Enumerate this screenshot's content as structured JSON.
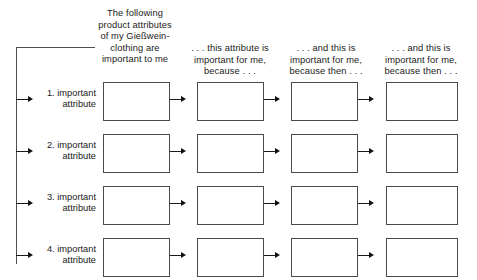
{
  "diagram": {
    "title_text": "Laddering interview grid",
    "columns": [
      {
        "id": "col-attributes",
        "header": "The following product attributes of my Gießwein-clothing are important to me"
      },
      {
        "id": "col-consequence-1",
        "header": ". . . this attribute is important for me, because . . ."
      },
      {
        "id": "col-consequence-2",
        "header": ". . . and this is important for me, because then . . ."
      },
      {
        "id": "col-value",
        "header": ". . . and this is important for me, because then . . ."
      }
    ],
    "rows": [
      {
        "number": "1.",
        "label_line1": "1. important",
        "label_line2": "attribute"
      },
      {
        "number": "2.",
        "label_line1": "2. important",
        "label_line2": "attribute"
      },
      {
        "number": "3.",
        "label_line1": "3. important",
        "label_line2": "attribute"
      },
      {
        "number": "4.",
        "label_line1": "4. important",
        "label_line2": "attribute"
      }
    ],
    "cells": [
      [
        "",
        "",
        "",
        ""
      ],
      [
        "",
        "",
        "",
        ""
      ],
      [
        "",
        "",
        "",
        ""
      ],
      [
        "",
        "",
        "",
        ""
      ]
    ],
    "colors": {
      "background": "#ffffff",
      "box_border": "#4a4a4a",
      "line": "#1a1a1a",
      "bracket": "#4d4d4d",
      "text": "#1a1a1a"
    }
  }
}
